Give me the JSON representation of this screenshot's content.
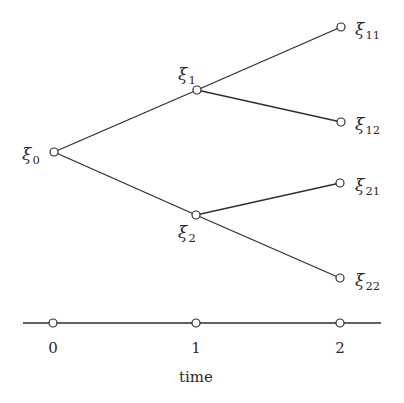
{
  "diagram": {
    "type": "scenario-tree",
    "nodes": [
      {
        "id": "xi0",
        "symbol": "ξ",
        "sub": "0",
        "x": 54,
        "y": 152,
        "label_x": 22,
        "label_y": 160,
        "label_anchor": "start"
      },
      {
        "id": "xi1",
        "symbol": "ξ",
        "sub": "1",
        "x": 197,
        "y": 90,
        "label_x": 178,
        "label_y": 80,
        "label_anchor": "start"
      },
      {
        "id": "xi2",
        "symbol": "ξ",
        "sub": "2",
        "x": 196,
        "y": 215,
        "label_x": 178,
        "label_y": 238,
        "label_anchor": "start"
      },
      {
        "id": "xi11",
        "symbol": "ξ",
        "sub": "11",
        "x": 341,
        "y": 27,
        "label_x": 355,
        "label_y": 35,
        "label_anchor": "start"
      },
      {
        "id": "xi12",
        "symbol": "ξ",
        "sub": "12",
        "x": 341,
        "y": 122,
        "label_x": 355,
        "label_y": 130,
        "label_anchor": "start"
      },
      {
        "id": "xi21",
        "symbol": "ξ",
        "sub": "21",
        "x": 340,
        "y": 183,
        "label_x": 355,
        "label_y": 191,
        "label_anchor": "start"
      },
      {
        "id": "xi22",
        "symbol": "ξ",
        "sub": "22",
        "x": 340,
        "y": 278,
        "label_x": 355,
        "label_y": 286,
        "label_anchor": "start"
      }
    ],
    "edges": [
      {
        "from": "xi0",
        "to": "xi1"
      },
      {
        "from": "xi0",
        "to": "xi2"
      },
      {
        "from": "xi1",
        "to": "xi11"
      },
      {
        "from": "xi1",
        "to": "xi12"
      },
      {
        "from": "xi2",
        "to": "xi21"
      },
      {
        "from": "xi2",
        "to": "xi22"
      }
    ],
    "time_axis": {
      "y": 323,
      "x_start": 23,
      "x_end": 381,
      "ticks": [
        {
          "label": "0",
          "x": 53
        },
        {
          "label": "1",
          "x": 196
        },
        {
          "label": "2",
          "x": 340
        }
      ],
      "tick_label_y": 353,
      "title": "time",
      "title_x": 196,
      "title_y": 382
    }
  }
}
